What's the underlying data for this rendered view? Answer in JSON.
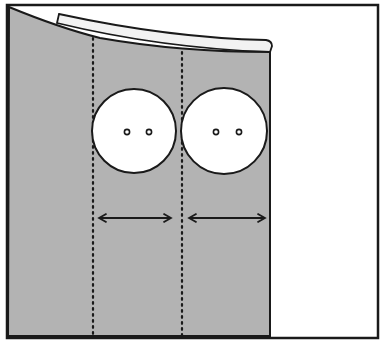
{
  "diagram": {
    "colors": {
      "background": "#ffffff",
      "fabric": "#b3b3b3",
      "facing": "#ffffff",
      "outline": "#1a1a1a",
      "button_fill": "#ffffff"
    },
    "frame": {
      "x": 7,
      "y": 5,
      "width": 371,
      "height": 333
    },
    "fabric_panel": {
      "left": 8,
      "right": 270,
      "bottom": 336
    },
    "stitch_lines": [
      {
        "name": "left-placement-line",
        "x": 93
      },
      {
        "name": "center-placement-line",
        "x": 182
      }
    ],
    "buttons": [
      {
        "name": "button-1",
        "cx": 134,
        "cy": 131,
        "r": 42,
        "holes": 2
      },
      {
        "name": "button-2",
        "cx": 224,
        "cy": 131,
        "r": 43,
        "holes": 2
      }
    ],
    "measure_arrows": [
      {
        "name": "spacing-arrow-1",
        "x1": 98,
        "x2": 172,
        "y": 218
      },
      {
        "name": "spacing-arrow-2",
        "x1": 188,
        "x2": 266,
        "y": 218
      }
    ]
  }
}
